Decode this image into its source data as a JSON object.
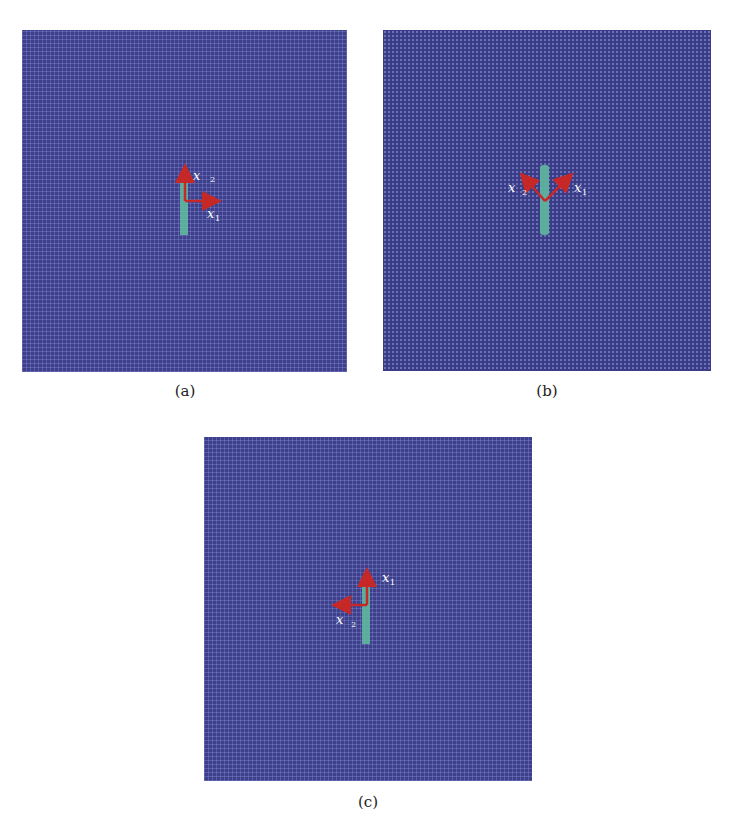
{
  "figure": {
    "panels": [
      {
        "id": "a",
        "caption": "(a)",
        "description": "Lattice with vertical crack, axes x1 to the right, x2 upward",
        "axis_labels": {
          "x1": "x",
          "x1_sub": "1",
          "x2": "x",
          "x2_sub": "2"
        }
      },
      {
        "id": "b",
        "caption": "(b)",
        "description": "Lattice with vertical crack, axes rotated 45 degrees: x1 up-right, x2 up-left",
        "axis_labels": {
          "x1": "x",
          "x1_sub": "1",
          "x2": "x",
          "x2_sub": "2"
        }
      },
      {
        "id": "c",
        "caption": "(c)",
        "description": "Lattice with vertical crack, axes x1 upward, x2 to the left",
        "axis_labels": {
          "x1": "x",
          "x1_sub": "1",
          "x2": "x",
          "x2_sub": "2"
        }
      }
    ],
    "colors": {
      "lattice": "#3d3f8a",
      "crack": "#5fb8a0",
      "arrow": "#c62828",
      "label": "#ffffff"
    }
  }
}
